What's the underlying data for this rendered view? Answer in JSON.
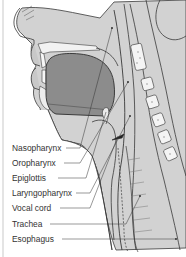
{
  "diagram": {
    "labels": [
      {
        "id": "nasopharynx",
        "text": "Nasopharynx"
      },
      {
        "id": "oropharynx",
        "text": "Oropharynx"
      },
      {
        "id": "epiglottis",
        "text": "Epiglottis"
      },
      {
        "id": "laryngopharynx",
        "text": "Laryngopharynx"
      },
      {
        "id": "vocal-cord",
        "text": "Vocal cord"
      },
      {
        "id": "trachea",
        "text": "Trachea"
      },
      {
        "id": "esophagus",
        "text": "Esophagus"
      }
    ],
    "colors": {
      "tissue": "#cfcfcf",
      "tissue_light": "#e4e4e4",
      "cavity_dark": "#8a8a8a",
      "outline": "#3a3a3a",
      "bone": "#f4f4f4",
      "text": "#333333"
    }
  }
}
